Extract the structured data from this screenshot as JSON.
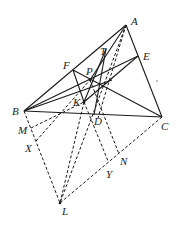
{
  "diagram": {
    "type": "geometry-figure",
    "points": {
      "A": {
        "label": "A",
        "x": 126,
        "y": 25
      },
      "B": {
        "label": "B",
        "x": 24,
        "y": 111
      },
      "C": {
        "label": "C",
        "x": 162,
        "y": 117
      },
      "D": {
        "label": "D",
        "x": 94,
        "y": 115
      },
      "E": {
        "label": "E",
        "x": 138,
        "y": 56
      },
      "F": {
        "label": "F",
        "x": 73,
        "y": 70
      },
      "P": {
        "label": "P",
        "x": 90,
        "y": 80
      },
      "T": {
        "label": "T",
        "x": 106,
        "y": 49
      },
      "K": {
        "label": "K",
        "x": 84,
        "y": 102
      },
      "M": {
        "label": "M",
        "x": 31,
        "y": 128
      },
      "X": {
        "label": "X",
        "x": 36,
        "y": 141
      },
      "N": {
        "label": "N",
        "x": 119,
        "y": 154
      },
      "Y": {
        "label": "Y",
        "x": 108,
        "y": 161
      },
      "L": {
        "label": "L",
        "x": 60,
        "y": 203
      }
    },
    "labels": [
      "A",
      "B",
      "C",
      "D",
      "E",
      "F",
      "P",
      "T",
      "K",
      "M",
      "X",
      "N",
      "Y",
      "L"
    ]
  }
}
